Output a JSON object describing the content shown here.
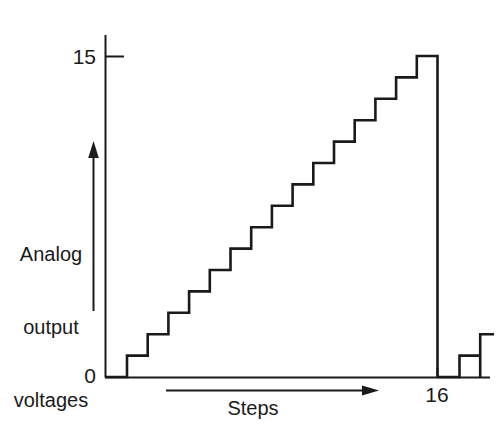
{
  "figure": {
    "background_color": "#ffffff",
    "line_color": "#1a1a1a"
  },
  "axis_labels": {
    "y_max": "15",
    "y_zero": "0",
    "x_end": "16",
    "y_title_line1": "Analog",
    "y_title_line2": "output",
    "y_title_line3": "voltages",
    "y_title": "Analog output voltages",
    "x_title": "Steps"
  },
  "chart_data": {
    "type": "line",
    "title": "",
    "subtitle": "",
    "xlabel": "Steps",
    "ylabel": "Analog output voltages",
    "step_shape": "staircase",
    "grid": false,
    "legend": null,
    "xlim": [
      0,
      18
    ],
    "ylim": [
      0,
      15
    ],
    "xticks": [
      0,
      16
    ],
    "xticklabels": [
      "0",
      "16"
    ],
    "yticks": [
      0,
      15
    ],
    "yticklabels": [
      "0",
      "15"
    ],
    "x": [
      0,
      1,
      2,
      3,
      4,
      5,
      6,
      7,
      8,
      9,
      10,
      11,
      12,
      13,
      14,
      15,
      16,
      17,
      18
    ],
    "values": [
      0,
      1,
      2,
      3,
      4,
      5,
      6,
      7,
      8,
      9,
      10,
      11,
      12,
      13,
      14,
      15,
      0,
      1,
      2
    ],
    "series": [
      {
        "name": "Analog output voltage",
        "values": [
          0,
          1,
          2,
          3,
          4,
          5,
          6,
          7,
          8,
          9,
          10,
          11,
          12,
          13,
          14,
          15,
          0,
          1,
          2
        ]
      }
    ],
    "annotations": [
      {
        "text": "15",
        "axis": "y",
        "value": 15
      },
      {
        "text": "0",
        "axis": "y",
        "value": 0
      },
      {
        "text": "16",
        "axis": "x",
        "value": 16
      }
    ],
    "arrows": [
      {
        "name": "y-axis-direction-arrow",
        "orientation": "vertical",
        "direction": "up"
      },
      {
        "name": "x-axis-direction-arrow",
        "orientation": "horizontal",
        "direction": "right"
      }
    ]
  }
}
